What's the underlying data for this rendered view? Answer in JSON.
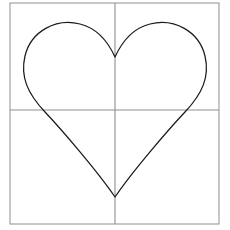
{
  "figure": {
    "background_color": "#ffffff",
    "width": 230,
    "height": 230
  },
  "frame": {
    "name": "plot-border",
    "color": "#9a9a9a",
    "stroke_width": 1.1,
    "left": 10,
    "top": 3,
    "right": 219,
    "bottom": 224
  },
  "axes": {
    "horizontal": {
      "label": "x-axis",
      "color": "#8f8f8f",
      "stroke_width": 1.1,
      "y": 110,
      "x_start": 10,
      "x_end": 219
    },
    "vertical": {
      "label": "y-axis",
      "color": "#8f8f8f",
      "stroke_width": 1.1,
      "x": 115,
      "y_start": 3,
      "y_end": 224
    }
  },
  "curve": {
    "name": "heart-curve",
    "color": "#1a1a1a",
    "stroke_width": 1.25,
    "fill": "none",
    "cusp_point": [
      115,
      57
    ],
    "bottom_tip": [
      115,
      197
    ],
    "left_extreme": [
      25,
      72
    ],
    "right_extreme": [
      205,
      72
    ],
    "left_lobe_top": [
      68,
      24
    ],
    "right_lobe_top": [
      162,
      24
    ],
    "axis_crossing_left": [
      45,
      110
    ],
    "axis_crossing_right": [
      185,
      110
    ],
    "path": "M 115 57 C 110 46 100 29 80 24 C 56 18 31 31 25 56 C 20 77 28 94 45 112 C 62 130 98 172 115 197 C 132 172 168 130 185 112 C 202 94 210 77 205 56 C 199 31 174 18 150 24 C 130 29 120 46 115 57 Z"
  },
  "chart_data": {
    "type": "line",
    "xlabel": "",
    "ylabel": "",
    "grid": true,
    "legend": "none",
    "series": [
      {
        "name": "heart",
        "description": "Closed parametric heart-shaped curve, symmetric about the vertical axis"
      }
    ],
    "annotations": [
      "cusp at top center on the vertical axis",
      "bottom tip on the vertical axis",
      "two rounded lobes above the horizontal axis"
    ]
  }
}
